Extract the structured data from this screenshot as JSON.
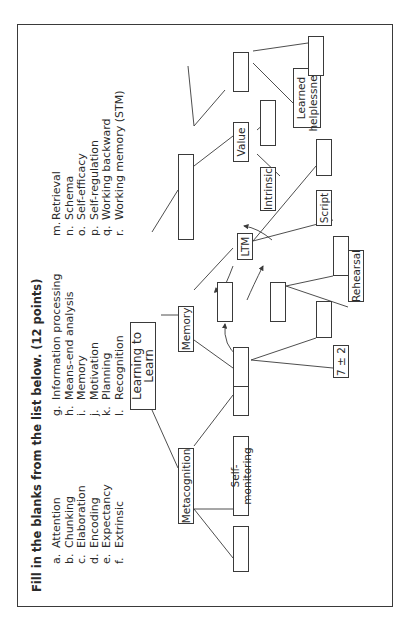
{
  "worksheet": {
    "title": "Fill in the blanks from the list below. (12 points)",
    "word_bank": {
      "column1": [
        {
          "letter": "a.",
          "term": "Attention"
        },
        {
          "letter": "b.",
          "term": "Chunking"
        },
        {
          "letter": "c.",
          "term": "Elaboration"
        },
        {
          "letter": "d.",
          "term": "Encoding"
        },
        {
          "letter": "e.",
          "term": "Expectancy"
        },
        {
          "letter": "f.",
          "term": "Extrinsic"
        }
      ],
      "column2": [
        {
          "letter": "g.",
          "term": "Information processing"
        },
        {
          "letter": "h.",
          "term": "Means-end analysis"
        },
        {
          "letter": "i.",
          "term": "Memory"
        },
        {
          "letter": "j.",
          "term": "Motivation"
        },
        {
          "letter": "k.",
          "term": "Planning"
        },
        {
          "letter": "l.",
          "term": "Recognition"
        }
      ],
      "column3": [
        {
          "letter": "m.",
          "term": "Retrieval"
        },
        {
          "letter": "n.",
          "term": "Schema"
        },
        {
          "letter": "o.",
          "term": "Self-efficacy"
        },
        {
          "letter": "p.",
          "term": "Self-regulation"
        },
        {
          "letter": "q.",
          "term": "Working backward"
        },
        {
          "letter": "r.",
          "term": "Working memory (STM)"
        }
      ]
    },
    "diagram": {
      "root": "Learning to Learn",
      "metacognition": "Metacognition",
      "self_monitoring": "Self-monitoring",
      "memory": "Memory",
      "ltm": "LTM",
      "seven_plus_minus_two": "7 ± 2",
      "rehearsal": "Rehearsal",
      "script": "Script",
      "value": "Value",
      "intrinsic": "Intrinsic",
      "learned_helplessness_line1": "Learned",
      "learned_helplessness_line2": "helplessness"
    },
    "colors": {
      "line": "#3a3a3a",
      "text": "#2a2a2a"
    }
  }
}
